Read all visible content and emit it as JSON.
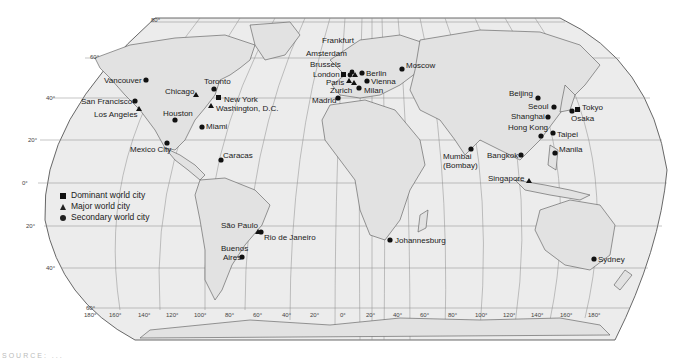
{
  "map": {
    "projection": "Robinson-like world projection",
    "background_color": "#ffffff",
    "ocean_color": "#ececec",
    "land_line_color": "#555555",
    "graticule_color": "#888888"
  },
  "legend": {
    "items": [
      {
        "symbol": "square",
        "label": "Dominant world city"
      },
      {
        "symbol": "triangle",
        "label": "Major world city"
      },
      {
        "symbol": "circle",
        "label": "Secondary world city"
      }
    ]
  },
  "latitude_labels": [
    "80°",
    "60°",
    "40°",
    "20°",
    "0°",
    "20°",
    "40°",
    "60°"
  ],
  "longitude_labels": [
    "180°",
    "160°",
    "140°",
    "120°",
    "100°",
    "80°",
    "60°",
    "40°",
    "20°",
    "0°",
    "20°",
    "40°",
    "60°",
    "80°",
    "100°",
    "120°",
    "140°",
    "160°",
    "180°"
  ],
  "cities": [
    {
      "name": "Vancouver",
      "type": "circle"
    },
    {
      "name": "Chicago",
      "type": "triangle"
    },
    {
      "name": "Toronto",
      "type": "circle"
    },
    {
      "name": "San Francisco",
      "type": "circle"
    },
    {
      "name": "New York",
      "type": "square"
    },
    {
      "name": "Washington, D.C.",
      "type": "triangle"
    },
    {
      "name": "Los Angeles",
      "type": "triangle"
    },
    {
      "name": "Houston",
      "type": "circle"
    },
    {
      "name": "Miami",
      "type": "circle"
    },
    {
      "name": "Mexico City",
      "type": "circle"
    },
    {
      "name": "Caracas",
      "type": "circle"
    },
    {
      "name": "São Paulo",
      "type": "triangle"
    },
    {
      "name": "Rio de Janeiro",
      "type": "circle"
    },
    {
      "name": "Buenos Aires",
      "type": "circle"
    },
    {
      "name": "Frankfurt",
      "type": "triangle"
    },
    {
      "name": "Amsterdam",
      "type": "circle"
    },
    {
      "name": "Brussels",
      "type": "circle"
    },
    {
      "name": "London",
      "type": "square"
    },
    {
      "name": "Paris",
      "type": "triangle"
    },
    {
      "name": "Zurich",
      "type": "triangle"
    },
    {
      "name": "Berlin",
      "type": "circle"
    },
    {
      "name": "Vienna",
      "type": "circle"
    },
    {
      "name": "Milan",
      "type": "circle"
    },
    {
      "name": "Madrid",
      "type": "circle"
    },
    {
      "name": "Moscow",
      "type": "circle"
    },
    {
      "name": "Johannesburg",
      "type": "circle"
    },
    {
      "name": "Mumbai (Bombay)",
      "type": "circle"
    },
    {
      "name": "Beijing",
      "type": "circle"
    },
    {
      "name": "Seoul",
      "type": "circle"
    },
    {
      "name": "Shanghai",
      "type": "circle"
    },
    {
      "name": "Hong Kong",
      "type": "circle"
    },
    {
      "name": "Taipei",
      "type": "circle"
    },
    {
      "name": "Bangkok",
      "type": "circle"
    },
    {
      "name": "Manila",
      "type": "circle"
    },
    {
      "name": "Singapore",
      "type": "triangle"
    },
    {
      "name": "Tokyo",
      "type": "square"
    },
    {
      "name": "Osaka",
      "type": "circle"
    },
    {
      "name": "Sydney",
      "type": "circle"
    }
  ],
  "labels": {
    "vancouver": "Vancouver",
    "chicago": "Chicago",
    "toronto": "Toronto",
    "san_francisco": "San Francisco",
    "new_york": "New York",
    "washington": "Washington, D.C.",
    "los_angeles": "Los Angeles",
    "houston": "Houston",
    "miami": "Miami",
    "mexico_city": "Mexico City",
    "caracas": "Caracas",
    "sao_paulo": "São Paulo",
    "rio": "Rio de Janeiro",
    "buenos_aires_1": "Buenos",
    "buenos_aires_2": "Aires",
    "frankfurt": "Frankfurt",
    "amsterdam": "Amsterdam",
    "brussels": "Brussels",
    "london": "London",
    "paris": "Paris",
    "zurich": "Zurich",
    "berlin": "Berlin",
    "vienna": "Vienna",
    "milan": "Milan",
    "madrid": "Madrid",
    "moscow": "Moscow",
    "johannesburg": "Johannesburg",
    "mumbai_1": "Mumbai",
    "mumbai_2": "(Bombay)",
    "beijing": "Beijing",
    "seoul": "Seoul",
    "shanghai": "Shanghai",
    "hong_kong": "Hong Kong",
    "taipei": "Taipei",
    "bangkok": "Bangkok",
    "manila": "Manila",
    "singapore": "Singapore",
    "tokyo": "Tokyo",
    "osaka": "Osaka",
    "sydney": "Sydney"
  },
  "source_text": "SOURCE: ..."
}
